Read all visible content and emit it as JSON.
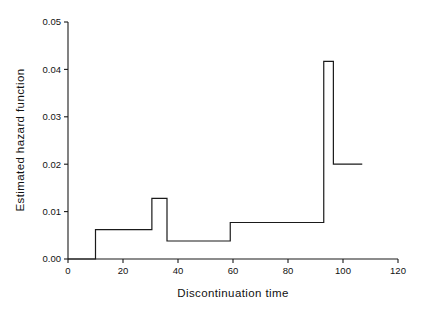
{
  "chart_data": {
    "type": "line",
    "subtype": "step-function",
    "title": "",
    "subtitle": "",
    "xlabel": "Discontinuation time",
    "ylabel": "Estimated hazard function",
    "xlim": [
      0,
      120
    ],
    "ylim": [
      0.0,
      0.05
    ],
    "grid": false,
    "legend": null,
    "legend_position": "none",
    "xticks": [
      0,
      20,
      40,
      60,
      80,
      100,
      120
    ],
    "xtick_labels": [
      "0",
      "20",
      "40",
      "60",
      "80",
      "100",
      "120"
    ],
    "yticks": [
      0.0,
      0.01,
      0.02,
      0.03,
      0.04,
      0.05
    ],
    "ytick_labels": [
      "0.00",
      "0.01",
      "0.02",
      "0.03",
      "0.04",
      "0.05"
    ],
    "line_color": "#1a1a1a",
    "line_width": 1.2,
    "axes_color": "#1a1a1a",
    "background_color": "#ffffff",
    "series": [
      {
        "name": "Estimated hazard function",
        "step_style": "post",
        "segments": [
          {
            "x_start": 0,
            "x_end": 10,
            "y": 0.0
          },
          {
            "x_start": 10,
            "x_end": 30.5,
            "y": 0.0062
          },
          {
            "x_start": 30.5,
            "x_end": 36,
            "y": 0.0128
          },
          {
            "x_start": 36,
            "x_end": 59,
            "y": 0.0038
          },
          {
            "x_start": 59,
            "x_end": 93,
            "y": 0.0077
          },
          {
            "x_start": 93,
            "x_end": 96.5,
            "y": 0.0417
          },
          {
            "x_start": 96.5,
            "x_end": 107,
            "y": 0.02
          }
        ],
        "x": [
          0,
          10,
          10,
          30.5,
          30.5,
          36,
          36,
          59,
          59,
          93,
          93,
          96.5,
          96.5,
          107
        ],
        "y": [
          0.0,
          0.0,
          0.0062,
          0.0062,
          0.0128,
          0.0128,
          0.0038,
          0.0038,
          0.0077,
          0.0077,
          0.0417,
          0.0417,
          0.02,
          0.02
        ]
      }
    ]
  }
}
